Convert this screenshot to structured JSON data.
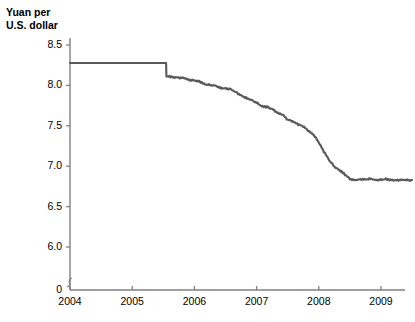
{
  "chart_data": {
    "type": "line",
    "title": "",
    "ylabel": "Yuan per\nU.S. dollar",
    "xlabel": "",
    "ylim": [
      5.85,
      8.62
    ],
    "xlim": [
      2004.0,
      2009.58
    ],
    "grid": false,
    "legend": null,
    "line_color": "#595959",
    "axis_color": "#808080",
    "y_ticks": [
      "0",
      "6.0",
      "6.5",
      "7.0",
      "7.5",
      "8.0",
      "8.5"
    ],
    "y_tick_values": [
      0,
      6.0,
      6.5,
      7.0,
      7.5,
      8.0,
      8.5
    ],
    "y_axis_break": true,
    "x_ticks": [
      "2004",
      "2005",
      "2006",
      "2007",
      "2008",
      "2009"
    ],
    "x_tick_values": [
      2004,
      2005,
      2006,
      2007,
      2008,
      2009
    ],
    "series": [
      {
        "name": "Yuan per U.S. dollar",
        "x": [
          2004.0,
          2004.08,
          2004.17,
          2004.25,
          2004.33,
          2004.42,
          2004.5,
          2004.58,
          2004.67,
          2004.75,
          2004.83,
          2004.92,
          2005.0,
          2005.08,
          2005.17,
          2005.25,
          2005.33,
          2005.42,
          2005.5,
          2005.545,
          2005.55,
          2005.6,
          2005.67,
          2005.75,
          2005.83,
          2005.92,
          2006.0,
          2006.08,
          2006.17,
          2006.25,
          2006.33,
          2006.42,
          2006.5,
          2006.58,
          2006.67,
          2006.75,
          2006.83,
          2006.92,
          2007.0,
          2007.08,
          2007.17,
          2007.25,
          2007.33,
          2007.42,
          2007.5,
          2007.58,
          2007.67,
          2007.75,
          2007.83,
          2007.92,
          2008.0,
          2008.08,
          2008.17,
          2008.25,
          2008.33,
          2008.42,
          2008.5,
          2008.58,
          2008.62,
          2008.67,
          2008.75,
          2008.83,
          2008.92,
          2009.0,
          2009.08,
          2009.17,
          2009.25,
          2009.33,
          2009.42,
          2009.5
        ],
        "y": [
          8.277,
          8.277,
          8.277,
          8.277,
          8.277,
          8.277,
          8.277,
          8.277,
          8.277,
          8.277,
          8.277,
          8.277,
          8.277,
          8.277,
          8.277,
          8.277,
          8.277,
          8.277,
          8.277,
          8.277,
          8.11,
          8.105,
          8.1,
          8.092,
          8.085,
          8.07,
          8.06,
          8.042,
          8.02,
          8.005,
          7.995,
          7.975,
          7.965,
          7.955,
          7.92,
          7.88,
          7.85,
          7.82,
          7.79,
          7.75,
          7.73,
          7.71,
          7.67,
          7.63,
          7.575,
          7.56,
          7.51,
          7.49,
          7.44,
          7.38,
          7.29,
          7.18,
          7.07,
          6.99,
          6.945,
          6.9,
          6.84,
          6.82,
          6.835,
          6.845,
          6.835,
          6.84,
          6.835,
          6.835,
          6.84,
          6.835,
          6.83,
          6.835,
          6.832,
          6.83
        ],
        "annotation": "Flat peg at 8.28 through mid-2005, then steady appreciation to about 6.83 by late 2008, then flat."
      }
    ]
  }
}
